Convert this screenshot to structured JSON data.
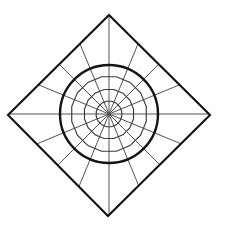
{
  "figure": {
    "background_color": "#ffffff",
    "width": 226,
    "height": 229
  },
  "chart_data": {
    "type": "line",
    "xlabel": "",
    "ylabel": "",
    "grid": true,
    "legend_position": "none",
    "center": {
      "x": 109,
      "y": 114
    },
    "outer_square": {
      "name": "diamond-outline",
      "rotation_deg": 45,
      "stroke": "#111111",
      "stroke_width": 2.1,
      "vertices": [
        {
          "label": "top",
          "x": 109,
          "y": 15
        },
        {
          "label": "right",
          "x": 210,
          "y": 115
        },
        {
          "label": "bottom",
          "x": 108,
          "y": 216
        },
        {
          "label": "left",
          "x": 8,
          "y": 115
        }
      ]
    },
    "bold_circle": {
      "name": "bold-circle",
      "cx": 109,
      "cy": 114,
      "r": 49,
      "stroke": "#141414",
      "stroke_width": 2.4
    },
    "spokes": {
      "name": "radial-spokes",
      "count": 16,
      "angles_deg": [
        0,
        22.5,
        45,
        67.5,
        90,
        112.5,
        135,
        157.5,
        180,
        202.5,
        225,
        247.5,
        270,
        292.5,
        315,
        337.5
      ],
      "stroke": "#4a4a4a",
      "stroke_width": 0.95,
      "note": "spokes run from the centre out to the diamond boundary"
    },
    "polygon_rings": [
      {
        "name": "ring-inner",
        "sides": 16,
        "radius": 13,
        "stroke": "#3a3a3a",
        "stroke_width": 1.15
      },
      {
        "name": "ring-mid",
        "sides": 16,
        "radius": 25,
        "stroke": "#3a3a3a",
        "stroke_width": 1.15
      },
      {
        "name": "ring-outer",
        "sides": 16,
        "radius": 38,
        "stroke": "#3a3a3a",
        "stroke_width": 1.15
      }
    ],
    "radial_ticks": [
      13,
      25,
      38,
      49
    ],
    "colors": {
      "ink": "#111111",
      "mid_ink": "#3a3a3a",
      "light_ink": "#4a4a4a",
      "background": "#ffffff"
    }
  }
}
